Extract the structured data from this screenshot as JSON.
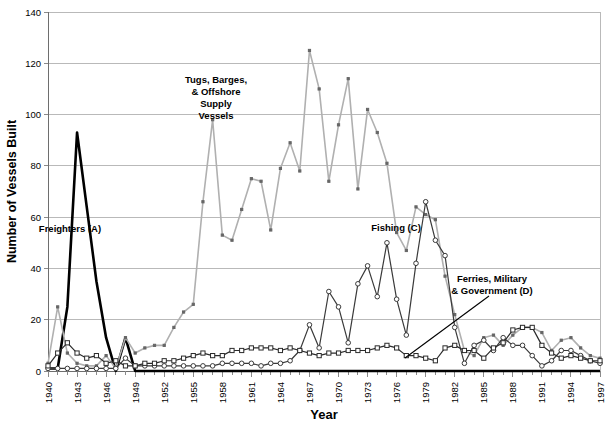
{
  "chart_data": {
    "type": "line",
    "title": "",
    "xlabel": "Year",
    "ylabel": "Number of Vessels Built",
    "xlim": [
      1940,
      1997
    ],
    "ylim": [
      0,
      140
    ],
    "ytick_step": 20,
    "xtick_label_step": 3,
    "grid": true,
    "legend": "none (series labeled inline with annotations)",
    "yticks": [
      "0",
      "20",
      "40",
      "60",
      "80",
      "100",
      "120",
      "140"
    ],
    "x": [
      1940,
      1941,
      1942,
      1943,
      1944,
      1945,
      1946,
      1947,
      1948,
      1949,
      1950,
      1951,
      1952,
      1953,
      1954,
      1955,
      1956,
      1957,
      1958,
      1959,
      1960,
      1961,
      1962,
      1963,
      1964,
      1965,
      1966,
      1967,
      1968,
      1969,
      1970,
      1971,
      1972,
      1973,
      1974,
      1975,
      1976,
      1977,
      1978,
      1979,
      1980,
      1981,
      1982,
      1983,
      1984,
      1985,
      1986,
      1987,
      1988,
      1989,
      1990,
      1991,
      1992,
      1993,
      1994,
      1995,
      1996,
      1997
    ],
    "xtick_labels": [
      "1940",
      "1943",
      "1946",
      "1949",
      "1952",
      "1955",
      "1958",
      "1961",
      "1964",
      "1967",
      "1970",
      "1973",
      "1976",
      "1979",
      "1982",
      "1985",
      "1988",
      "1991",
      "1994",
      "1997"
    ],
    "series": [
      {
        "name": "Freighters (A)",
        "key": "freighters",
        "color": "#000000",
        "line_width": 2.6,
        "marker": "none",
        "values": [
          1,
          1,
          25,
          93,
          64,
          35,
          13,
          0,
          13,
          0,
          0,
          0,
          0,
          0,
          0,
          0,
          0,
          0,
          0,
          0,
          0,
          0,
          0,
          0,
          0,
          0,
          0,
          0,
          0,
          0,
          0,
          0,
          0,
          0,
          0,
          0,
          0,
          0,
          0,
          0,
          0,
          0,
          0,
          0,
          0,
          0,
          0,
          0,
          0,
          0,
          0,
          0,
          0,
          0,
          0,
          0,
          0,
          0
        ]
      },
      {
        "name": "Tugs, Barges, & Offshore Supply Vessels",
        "key": "tugs",
        "color": "#b0b0b0",
        "line_width": 1.6,
        "marker": "square",
        "values": [
          3,
          25,
          7,
          3,
          2,
          2,
          6,
          1,
          13,
          7,
          9,
          10,
          10,
          17,
          23,
          26,
          66,
          98,
          53,
          51,
          63,
          75,
          74,
          55,
          79,
          89,
          78,
          125,
          110,
          74,
          96,
          114,
          71,
          102,
          93,
          81,
          54,
          47,
          64,
          61,
          59,
          37,
          22,
          8,
          6,
          13,
          14,
          10,
          14,
          17,
          17,
          15,
          8,
          12,
          13,
          9,
          6,
          5
        ]
      },
      {
        "name": "Fishing (C)",
        "key": "fishing",
        "color": "#3a3a3a",
        "line_width": 1.2,
        "marker": "circle",
        "values": [
          1,
          1,
          1,
          1,
          1,
          1,
          1,
          1,
          5,
          2,
          2,
          2,
          2,
          2,
          2,
          2,
          2,
          2,
          3,
          3,
          3,
          3,
          2,
          3,
          3,
          4,
          8,
          18,
          9,
          31,
          25,
          11,
          34,
          41,
          29,
          50,
          28,
          14,
          42,
          66,
          51,
          45,
          17,
          3,
          10,
          12,
          8,
          13,
          10,
          10,
          6,
          2,
          4,
          8,
          8,
          6,
          4,
          3
        ]
      },
      {
        "name": "Ferries, Military & Government (D)",
        "key": "ferries",
        "color": "#2b2b2b",
        "line_width": 1.2,
        "marker": "square",
        "values": [
          2,
          7,
          11,
          7,
          5,
          6,
          3,
          4,
          2,
          2,
          3,
          3,
          4,
          4,
          5,
          6,
          7,
          6,
          6,
          8,
          8,
          9,
          9,
          9,
          8,
          9,
          8,
          7,
          6,
          7,
          7,
          8,
          8,
          8,
          9,
          10,
          9,
          6,
          6,
          5,
          4,
          9,
          10,
          8,
          8,
          5,
          9,
          11,
          16,
          17,
          17,
          10,
          7,
          5,
          6,
          5,
          4,
          4
        ]
      }
    ],
    "annotations": [
      {
        "key": "freighters_label",
        "text": "Freighters (A)",
        "lines": [
          "Freighters (A)"
        ],
        "x_px": 70,
        "y_px": 232
      },
      {
        "key": "tugs_label",
        "text": "Tugs, Barges, & Offshore Supply Vessels",
        "lines": [
          "Tugs, Barges,",
          "& Offshore",
          "Supply",
          "Vessels"
        ],
        "x_px": 216,
        "y_px": 83
      },
      {
        "key": "fishing_label",
        "text": "Fishing (C)",
        "lines": [
          "Fishing (C)"
        ],
        "x_px": 396,
        "y_px": 231
      },
      {
        "key": "ferries_label",
        "text": "Ferries, Military & Government (D)",
        "lines": [
          "Ferries, Military",
          "& Government (D)"
        ],
        "x_px": 492,
        "y_px": 282,
        "leader_from_px": [
          489,
          296
        ],
        "leader_to_px": [
          405,
          358
        ]
      }
    ]
  }
}
